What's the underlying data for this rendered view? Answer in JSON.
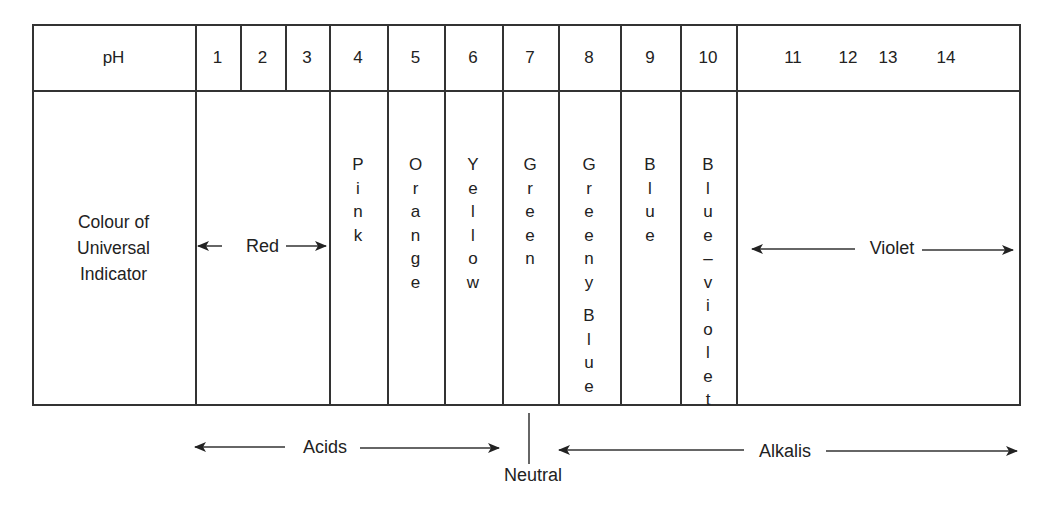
{
  "header": {
    "row_label": "pH",
    "ph_values": [
      "1",
      "2",
      "3",
      "4",
      "5",
      "6",
      "7",
      "8",
      "9",
      "10",
      "11",
      "12",
      "13",
      "14"
    ]
  },
  "body": {
    "row_label_lines": [
      "Colour of",
      "Universal",
      "Indicator"
    ],
    "colours": [
      {
        "ph": "1-3",
        "label": "Red",
        "orientation": "horizontal-arrow"
      },
      {
        "ph": "4",
        "label": "Pink",
        "orientation": "vertical"
      },
      {
        "ph": "5",
        "label": "Orange",
        "orientation": "vertical"
      },
      {
        "ph": "6",
        "label": "Yellow",
        "orientation": "vertical"
      },
      {
        "ph": "7",
        "label": "Green",
        "orientation": "vertical"
      },
      {
        "ph": "8",
        "label": "Greeny Blue",
        "orientation": "vertical"
      },
      {
        "ph": "9",
        "label": "Blue",
        "orientation": "vertical"
      },
      {
        "ph": "10",
        "label": "Blue–violet",
        "orientation": "vertical"
      },
      {
        "ph": "11-14",
        "label": "Violet",
        "orientation": "horizontal-arrow"
      }
    ]
  },
  "footer": {
    "acids_label": "Acids",
    "neutral_label": "Neutral",
    "alkalis_label": "Alkalis"
  },
  "icons": {
    "arrow": "double-headed-arrow"
  }
}
